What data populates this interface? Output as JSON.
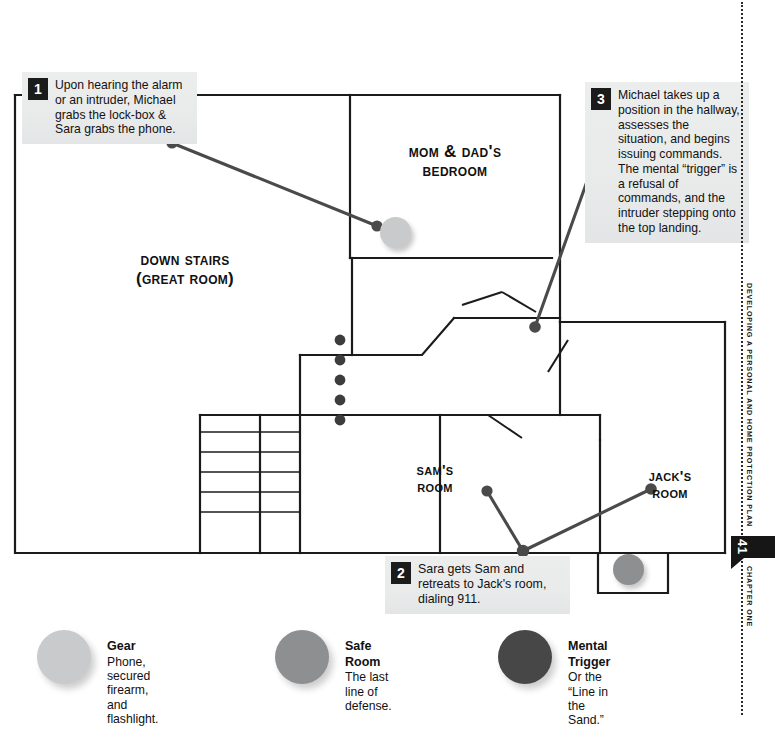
{
  "margin": {
    "running_head": "DEVELOPING A PERSONAL AND HOME PROTECTION PLAN",
    "page_number": "41",
    "chapter_label": "CHAPTER ONE"
  },
  "plan": {
    "rooms": [
      {
        "id": "mom-dad-bedroom",
        "label": "Mom & Dad's\nBedroom"
      },
      {
        "id": "down-stairs",
        "label": "Down Stairs\n(Great Room)"
      },
      {
        "id": "sams-room",
        "label": "Sam's\nRoom"
      },
      {
        "id": "jacks-room",
        "label": "Jack's\nRoom"
      }
    ],
    "markers": [
      {
        "id": "bedroom-gear",
        "type": "gear"
      },
      {
        "id": "jack-room-safe",
        "type": "safe"
      }
    ]
  },
  "callouts": [
    {
      "number": "1",
      "text": "Upon hearing the alarm or an intruder, Michael grabs the lock-box & Sara grabs the phone."
    },
    {
      "number": "2",
      "text": "Sara gets Sam and retreats to Jack's room, dialing 911."
    },
    {
      "number": "3",
      "text": "Michael takes up a position in the hallway, assesses the situation, and begins issuing commands.  The mental “trigger” is a refusal of commands, and the intruder stepping onto the top landing."
    }
  ],
  "legend": {
    "items": [
      {
        "id": "gear",
        "title": "Gear",
        "desc": "Phone, secured firearm,\nand flashlight.",
        "color": "#c9cacb"
      },
      {
        "id": "safe-room",
        "title": "Safe Room",
        "desc": "The last line of defense.",
        "color": "#8d8f90"
      },
      {
        "id": "mental-trigger",
        "title": "Mental Trigger",
        "desc": "Or the “Line in the Sand.”",
        "color": "#474747"
      }
    ]
  },
  "colors": {
    "wall": "#1b1b1b",
    "leader": "#3a3a3a",
    "callout_bg": "#eceded",
    "badge_bg": "#1b1b1b"
  }
}
